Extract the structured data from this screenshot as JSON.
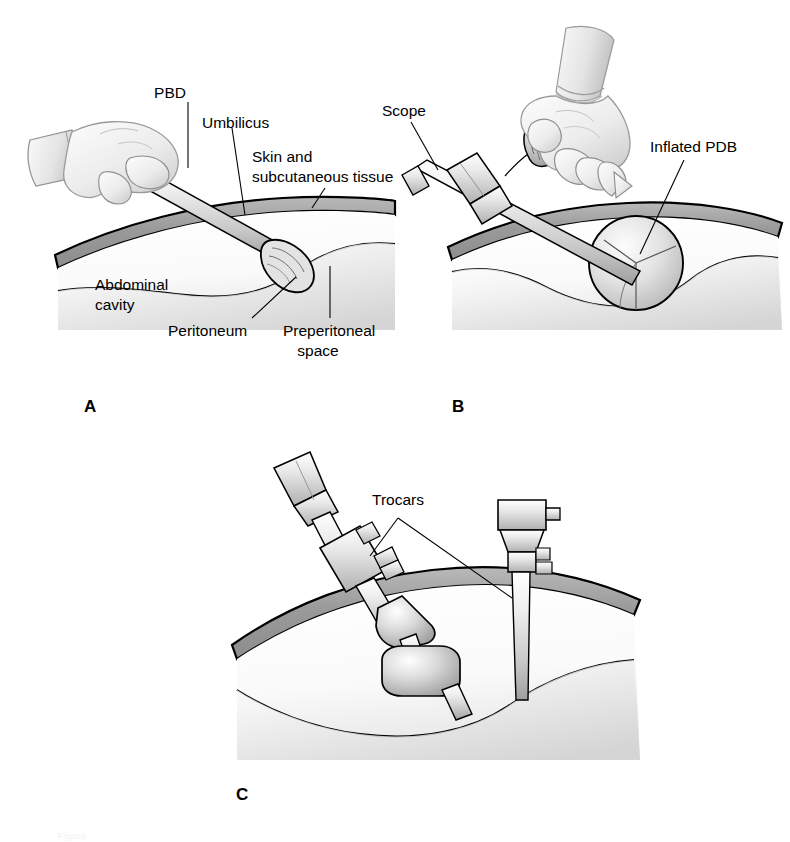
{
  "figure": {
    "panels": [
      {
        "letter": "A",
        "name": "panel-a-balloon-insertion",
        "labels": [
          {
            "id": "pbd",
            "text": "PBD"
          },
          {
            "id": "umbilicus",
            "text": "Umbilicus"
          },
          {
            "id": "skin",
            "text": "Skin and"
          },
          {
            "id": "skin2",
            "text": "subcutaneous tissue"
          },
          {
            "id": "abdominal",
            "text": "Abdominal"
          },
          {
            "id": "abdominal2",
            "text": "cavity"
          },
          {
            "id": "peritoneum",
            "text": "Peritoneum"
          },
          {
            "id": "preperitoneal",
            "text": "Preperitoneal"
          },
          {
            "id": "preperitoneal2",
            "text": "space"
          }
        ]
      },
      {
        "letter": "B",
        "name": "panel-b-balloon-inflation",
        "labels": [
          {
            "id": "scope",
            "text": "Scope"
          },
          {
            "id": "inflated-pdb",
            "text": "Inflated PDB"
          }
        ]
      },
      {
        "letter": "C",
        "name": "panel-c-trocar-placement",
        "labels": [
          {
            "id": "trocars",
            "text": "Trocars"
          }
        ]
      }
    ],
    "caption_fragment": "Figure"
  },
  "colors": {
    "ink": "#000000",
    "paper": "#ffffff",
    "wall_band": "#9a9a9a",
    "wall_band_light": "#c9c9c9",
    "tissue_light": "#ededed",
    "tissue_mid": "#d4d4d4",
    "tissue_shadow": "#b2b2b2",
    "instrument_light": "#f4f4f4",
    "instrument_mid": "#d8d8d8",
    "instrument_dark": "#a8a8a8",
    "glove": "#efefef",
    "glove_shade": "#cfcfcf",
    "balloon": "#dcdcdc"
  }
}
